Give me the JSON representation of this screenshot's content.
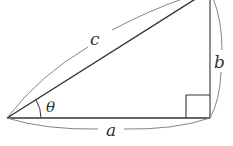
{
  "diagram": {
    "labels": {
      "hypotenuse": "c",
      "opposite": "b",
      "adjacent": "a",
      "angle": "θ"
    },
    "colors": {
      "line": "#333333",
      "arc": "#777777",
      "background": "#ffffff"
    }
  }
}
